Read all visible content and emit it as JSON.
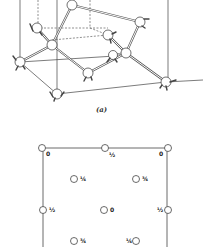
{
  "figure": {
    "part_a": {
      "caption": "(a)",
      "description": "3D ball-and-stick view of diamond cubic unit cell",
      "atoms": [
        {
          "x": 72,
          "y": 5
        },
        {
          "x": 140,
          "y": 22
        },
        {
          "x": 37,
          "y": 28
        },
        {
          "x": 108,
          "y": 35
        },
        {
          "x": 52,
          "y": 45
        },
        {
          "x": 126,
          "y": 53
        },
        {
          "x": 113,
          "y": 55
        },
        {
          "x": 20,
          "y": 62
        },
        {
          "x": 88,
          "y": 73
        },
        {
          "x": 57,
          "y": 94
        },
        {
          "x": 166,
          "y": 82
        }
      ],
      "bonds": [
        [
          0,
          1
        ],
        [
          0,
          4
        ],
        [
          2,
          4
        ],
        [
          4,
          7
        ],
        [
          4,
          5
        ],
        [
          1,
          5
        ],
        [
          5,
          3
        ],
        [
          5,
          10
        ],
        [
          3,
          0
        ],
        [
          4,
          8
        ],
        [
          8,
          5
        ],
        [
          6,
          5
        ],
        [
          8,
          9
        ],
        [
          7,
          9
        ],
        [
          9,
          10
        ]
      ]
    },
    "part_b": {
      "description": "Plan view projection with fractional heights",
      "labels": [
        {
          "pos": "top-left",
          "value": "0"
        },
        {
          "pos": "top-middle",
          "value": "½"
        },
        {
          "pos": "top-right",
          "value": "0"
        },
        {
          "pos": "inner-upper-left",
          "value": "¼"
        },
        {
          "pos": "inner-upper-right",
          "value": "¾"
        },
        {
          "pos": "middle-left",
          "value": "½"
        },
        {
          "pos": "center",
          "value": "0"
        },
        {
          "pos": "middle-right",
          "value": "½"
        },
        {
          "pos": "inner-lower-left",
          "value": "¾"
        },
        {
          "pos": "inner-lower-right",
          "value": "¼"
        }
      ]
    }
  }
}
